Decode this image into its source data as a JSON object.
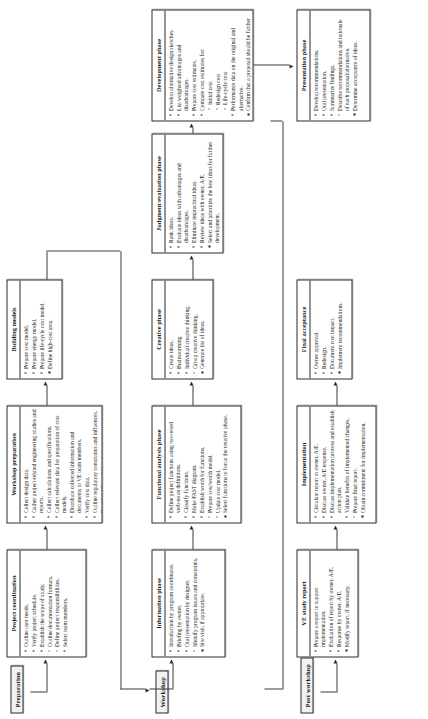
{
  "diagram": {
    "orientation": "rotated-90-ccw",
    "lanes": [
      {
        "id": "preparation",
        "label": "Preparation"
      },
      {
        "id": "workshop",
        "label": "Workshop"
      },
      {
        "id": "post_workshop",
        "label": "Post workshop"
      }
    ],
    "boxes": [
      {
        "id": "project_coordination",
        "lane": "preparation",
        "title": "Project coordination",
        "bullets": [
          "Outline user needs.",
          "Verify project schedule.",
          "Establish the scope of study.",
          "Outline documentation formats.",
          "Define project responsibilities.",
          "Select team members."
        ]
      },
      {
        "id": "workshop_preparation",
        "lane": "preparation",
        "title": "Workshop preparation",
        "bullets": [
          "Collect design data.",
          "Gather project-related engineering studies and reports.",
          "Collect calculations and specifications.",
          "Collect relevant data for preparation of cost models.",
          "Distribute collected information and documents to VE team members.",
          "Verify cost data.",
          "Outline regulatory constraints and influences.",
          "Establish VE study location."
        ]
      },
      {
        "id": "building_models",
        "lane": "preparation",
        "title": "Building models",
        "bullets": [
          "Prepare cost model.",
          "Prepare energy model.",
          "Prepare life-cycle cost model.",
          "Define high-cost area."
        ]
      },
      {
        "id": "information_phase",
        "lane": "workshop",
        "title": "Information phase",
        "bullets": [
          "Introduction by program coordinator.",
          "Briefing by owner.",
          "Oral presentation by designer.",
          "Identify program issues and constraints.",
          "Site visit, if appropriate."
        ]
      },
      {
        "id": "functional_analysis_phase",
        "lane": "workshop",
        "title": "Functional analysis phase",
        "bullets": [
          "Define project functions using two-word verb-noun definitions.",
          "Classify functions.",
          "Make FAST diagram.",
          "Establish worth for functions.",
          "Prepare cost/worth model.",
          "Update cost model.",
          "Select functions to focus the creative phase."
        ]
      },
      {
        "id": "creative_phase",
        "lane": "workshop",
        "title": "Creative phase",
        "bullets": [
          "Create ideas.",
          "Brainstorming.",
          "Individual creative thinking.",
          "Group creative thinking.",
          "Generate list of ideas."
        ]
      },
      {
        "id": "judgment_evaluation_phase",
        "lane": "workshop",
        "title": "Judgment/evaluation phase",
        "bullets": [
          "Rank ideas.",
          "Evaluate ideas with advantages and disadvantages.",
          "Eliminate impractical ideas.",
          "Review ideas with owner, A/E.",
          "Select and prioritize the best ideas for further development."
        ]
      },
      {
        "id": "development_phase",
        "lane": "workshop",
        "title": "Development phase",
        "bullets": [
          "Develop alternative design sketches.",
          "List weighted advantages and disadvantages.",
          "Prepare cost estimates.",
          "Compare cost estimates for:",
          "Initial cost",
          "Redesign cost",
          "Life-cycle cost",
          "Performance data on the original and alternative.",
          "Confirm that a proposal should be further developed."
        ],
        "sub_indices": [
          4,
          5,
          6
        ]
      },
      {
        "id": "presentation_phase",
        "lane": "workshop",
        "title": "Presentation phase",
        "bullets": [
          "Develop recommendations.",
          "Oral presentation.",
          "Summarize findings.",
          "Describe recommendations and rationale of each proposal/alternative.",
          "Determine acceptance of ideas."
        ]
      },
      {
        "id": "ve_study_report",
        "lane": "post_workshop",
        "title": "VE study report",
        "bullets": [
          "Prepare a report to support implementation.",
          "Evaluation of report by owner, A/E.",
          "Response by owner, A/E.",
          "Modify report, if necessary."
        ]
      },
      {
        "id": "implementation",
        "lane": "post_workshop",
        "title": "Implementation",
        "bullets": [
          "Circulate report to owner, A/E.",
          "Discuss owner, A/E response.",
          "Discuss implementation process and establish action plan.",
          "Validate benefits of implemented changes.",
          "Prepare final report.",
          "Obtain commitment for implementation."
        ]
      },
      {
        "id": "final_acceptance",
        "lane": "post_workshop",
        "title": "Final acceptance",
        "bullets": [
          "Owner approval.",
          "Redesign.",
          "Document cost impact.",
          "Implement recommendations."
        ]
      }
    ]
  }
}
